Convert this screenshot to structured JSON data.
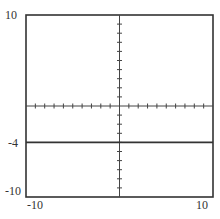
{
  "chart_data": {
    "type": "line",
    "title": "",
    "xlabel": "",
    "ylabel": "",
    "xlim": [
      -10,
      10
    ],
    "ylim": [
      -10,
      10
    ],
    "grid": false,
    "tick_interval": 1,
    "series": [
      {
        "name": "y = -4",
        "x": [
          -10,
          10
        ],
        "y": [
          -4,
          -4
        ]
      }
    ],
    "tick_labels": {
      "y_top": "10",
      "y_line": "-4",
      "y_bottom": "-10",
      "x_left": "-10",
      "x_right": "10"
    }
  },
  "colors": {
    "frame": "#333333",
    "line": "#333333",
    "axis": "#444444"
  }
}
